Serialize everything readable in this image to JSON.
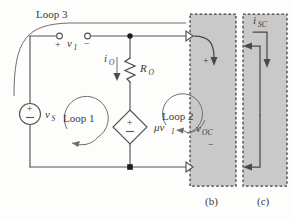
{
  "figure": {
    "title_parts": [
      "(b)",
      "(c)"
    ],
    "labels": {
      "loop3": "Loop 3",
      "loop1": "Loop 1",
      "loop2": "Loop 2",
      "v1": "v",
      "v1_sub": "1",
      "vs": "v",
      "vs_sub": "S",
      "io": "i",
      "io_sub": "O",
      "ro": "R",
      "ro_sub": "O",
      "dep_src": "μv",
      "dep_src_sub": "1",
      "voc": "v",
      "voc_sub": "OC",
      "isc": "i",
      "isc_sub": "SC",
      "plus": "+",
      "minus": "−"
    },
    "panel_b_label": "(b)",
    "panel_c_label": "(c)",
    "colors": {
      "background": "#fdfdfc",
      "wire": "#555555",
      "shade": "#c9c9c9",
      "dash_border": "#3d3d3d",
      "text": "#3a3a3a",
      "node": "#1c1c1c"
    },
    "components": [
      {
        "name": "independent-voltage-source",
        "label": "v_S",
        "type": "circle-source",
        "polarity": "plus-top"
      },
      {
        "name": "resistor",
        "label": "R_O",
        "type": "zigzag"
      },
      {
        "name": "dependent-voltage-source",
        "label": "μv_1",
        "type": "diamond-source",
        "polarity": "plus-top"
      },
      {
        "name": "open-circuit-port",
        "label": "v_OC",
        "type": "shaded-box"
      },
      {
        "name": "short-circuit-port",
        "label": "i_SC",
        "type": "shaded-box"
      }
    ],
    "loops": [
      {
        "name": "loop-1",
        "label": "Loop 1",
        "direction": "clockwise"
      },
      {
        "name": "loop-2",
        "label": "Loop 2",
        "direction": "clockwise"
      },
      {
        "name": "loop-3",
        "label": "Loop 3",
        "direction": "outer"
      }
    ]
  }
}
